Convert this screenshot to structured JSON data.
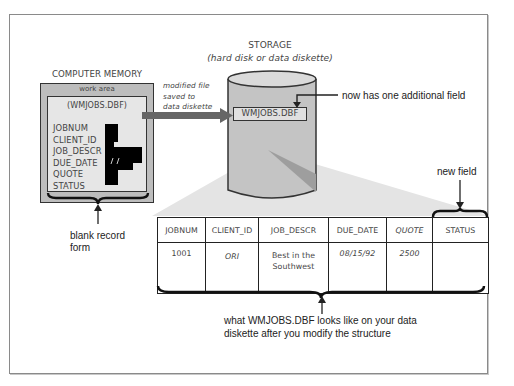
{
  "storage": {
    "title": "STORAGE",
    "subtitle": "(hard disk or data diskette)",
    "file_label": "WMJOBS.DBF",
    "annotation": "now has one additional field"
  },
  "memory": {
    "title": "COMPUTER MEMORY",
    "work_area_label": "work area",
    "file_label": "(WMJOBS.DBF)",
    "fields": [
      "JOBNUM",
      "CLIENT_ID",
      "JOB_DESCR",
      "DUE_DATE",
      "QUOTE",
      "STATUS"
    ],
    "brace_caption_line1": "blank record",
    "brace_caption_line2": "form"
  },
  "transfer_arrow": {
    "caption_line1": "modified file",
    "caption_line2": "saved to",
    "caption_line3": "data diskette"
  },
  "new_field_annotation": "new field",
  "table": {
    "headers": [
      "JOBNUM",
      "CLIENT_ID",
      "JOB_DESCR",
      "DUE_DATE",
      "QUOTE",
      "STATUS"
    ],
    "rows": [
      {
        "jobnum": "1001",
        "client_id": "ORI",
        "job_descr_line1": "Best in the",
        "job_descr_line2": "Southwest",
        "due_date": "08/15/92",
        "quote": "2500",
        "status": ""
      }
    ]
  },
  "bottom_caption": {
    "line1": "what WMJOBS.DBF looks like on your data",
    "line2": "diskette after you modify the structure"
  },
  "colors": {
    "frame_border": "#8a8a8a",
    "memory_outer": "#bdbdbd",
    "memory_inner": "#e6e6e6",
    "cylinder": "#c4c4c4",
    "shadow_wedge": "#e2e2e2",
    "arrow": "#666666"
  }
}
